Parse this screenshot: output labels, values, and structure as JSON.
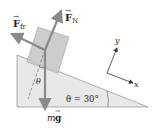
{
  "diagram": {
    "type": "free-body diagram",
    "labels": {
      "friction_force": "F",
      "friction_sub": "fr",
      "normal_force": "F",
      "normal_sub": "N",
      "weight_m": "m",
      "weight_g": "g",
      "theta_block": "θ",
      "incline_angle": "θ = 30°",
      "axis_x": "x",
      "axis_y": "y"
    },
    "incline_angle_deg": 30,
    "colors": {
      "incline_fill": "#e8e8e8",
      "incline_stroke": "#9a9a9a",
      "block_fill": "#c8c8c8",
      "vector": "#8a8a8a",
      "text": "#222222"
    }
  }
}
